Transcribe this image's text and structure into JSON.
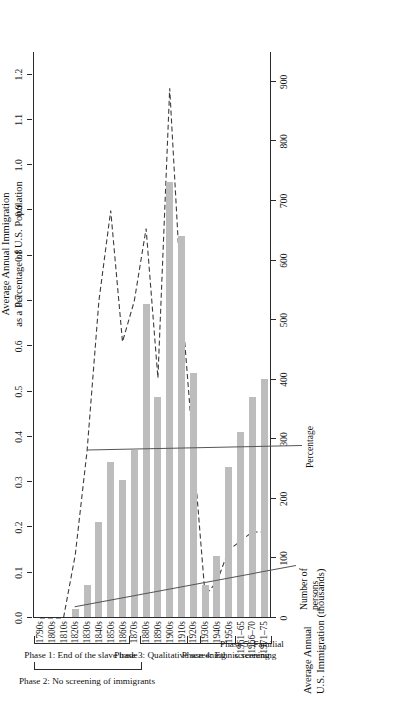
{
  "figure": {
    "top_axis_title_line1": "Average Annual Immigration",
    "top_axis_title_line2": "as a Percentage of U.S. Population",
    "bottom_axis_title_line1": "Average Annual",
    "bottom_axis_title_line2": "U.S. Immigration (thousands)",
    "series_label_percentage": "Percentage",
    "series_label_number_line1": "Number of",
    "series_label_number_line2": "persons",
    "bar_color": "#bdbdbd",
    "line_color": "#3c3c3c",
    "axis_color": "#2b2b2b"
  },
  "phases": [
    {
      "id": "phase-1",
      "line1": "Phase 1: End of the slave trade",
      "line2": "",
      "start": "1790s",
      "end": "1860s"
    },
    {
      "id": "phase-2",
      "line1": "Phase 2: No screening of immigrants",
      "line2": "",
      "start": "1790s",
      "end": "1870s"
    },
    {
      "id": "phase-3",
      "line1": "Phase 3: Qualitative screening",
      "line2": "",
      "start": "1880s",
      "end": "1920s"
    },
    {
      "id": "phase-4",
      "line1": "Phase 4: Ethnic screening",
      "line2": "",
      "start": "1920s",
      "end": "1960s"
    },
    {
      "id": "phase-5",
      "line1": "Phase 5: Familial",
      "line2": "screening",
      "start": "1961-65",
      "end": "1971-75"
    }
  ],
  "chart_data": {
    "type": "bar",
    "title": "Average Annual Immigration as a Percentage of U.S. Population",
    "subtitle": "Average Annual U.S. Immigration (thousands)",
    "xlabel": "",
    "ylabel": "Average Annual U.S. Immigration (thousands)",
    "y2label": "Average Annual Immigration as a Percentage of U.S. Population",
    "grid": false,
    "legend": "inline annotations",
    "categories": [
      "1790s",
      "1800s",
      "1810s",
      "1820s",
      "1830s",
      "1840s",
      "1850s",
      "1860s",
      "1870s",
      "1880s",
      "1890s",
      "1900s",
      "1910s",
      "1920s",
      "1930s",
      "1940s",
      "1950s",
      "1961-65",
      "1966-70",
      "1971-75"
    ],
    "ylim": [
      0,
      950
    ],
    "y2lim": [
      0,
      1.25
    ],
    "yticks": [
      0,
      100,
      200,
      300,
      400,
      500,
      600,
      700,
      800,
      900
    ],
    "ytick_labels": [
      "0",
      "100",
      "200",
      "300",
      "400",
      "500",
      "600",
      "700",
      "800",
      "900"
    ],
    "y2ticks": [
      0.0,
      0.1,
      0.2,
      0.3,
      0.4,
      0.5,
      0.6,
      0.7,
      0.8,
      0.9,
      1.0,
      1.1,
      1.2
    ],
    "y2tick_labels": [
      "0.0",
      "0.1",
      "0.2",
      "0.3",
      "0.4",
      "0.5",
      "0.6",
      "0.7",
      "0.8",
      "0.9",
      "1.0",
      "1.1",
      "1.2"
    ],
    "series": [
      {
        "name": "Number of persons",
        "type": "bar",
        "unit": "thousands per year",
        "values": [
          0,
          0,
          0,
          13,
          54,
          160,
          260,
          230,
          280,
          525,
          370,
          730,
          640,
          410,
          53,
          103,
          252,
          310,
          370,
          400
        ]
      },
      {
        "name": "Percentage",
        "type": "line",
        "unit": "percent of U.S. population",
        "values": [
          0.0,
          0.0,
          0.0,
          0.14,
          0.37,
          0.7,
          0.9,
          0.61,
          0.7,
          0.86,
          0.53,
          1.17,
          0.7,
          0.37,
          0.05,
          0.08,
          0.15,
          0.17,
          0.19,
          0.19
        ]
      }
    ]
  }
}
